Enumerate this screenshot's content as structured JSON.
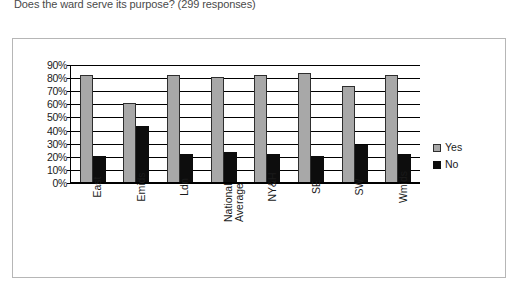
{
  "caption": "Does the ward serve its purpose? (299 responses)",
  "legend": {
    "items": [
      {
        "label": "Yes",
        "color": "#a8a8a8"
      },
      {
        "label": "No",
        "color": "#0d0d0d"
      }
    ]
  },
  "chart_data": {
    "type": "bar",
    "title": "Does the ward serve its purpose? (299 responses)",
    "xlabel": "",
    "ylabel": "",
    "ylim": [
      0,
      90
    ],
    "ytick_labels": [
      "90%",
      "80%",
      "70%",
      "60%",
      "50%",
      "40%",
      "30%",
      "20%",
      "10%",
      "0%"
    ],
    "ytick_values": [
      90,
      80,
      70,
      60,
      50,
      40,
      30,
      20,
      10,
      0
    ],
    "grid": true,
    "legend_position": "right",
    "categories": [
      "East",
      "Emids",
      "Ldn",
      "National Average",
      "NY&H",
      "SE",
      "SW",
      "Wmids"
    ],
    "series": [
      {
        "name": "Yes",
        "color": "#a8a8a8",
        "values": [
          82,
          60,
          82,
          80,
          82,
          83,
          73,
          82
        ]
      },
      {
        "name": "No",
        "color": "#0d0d0d",
        "values": [
          20,
          43,
          21,
          23,
          21,
          20,
          28,
          21
        ]
      }
    ]
  }
}
